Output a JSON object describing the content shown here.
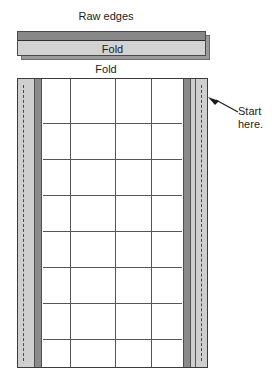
{
  "figure": {
    "title": "Raw edges",
    "strip": {
      "fold_label": "Fold",
      "raw_edge_color": "#888888",
      "face_color": "#d2d2d2",
      "depth_color": "#9a9a9a"
    },
    "fold_caption": "Fold",
    "callout": {
      "text": "Start here.",
      "arrow_direction": "left"
    },
    "panel": {
      "selvage_color": "#cfcfcf",
      "seam_band_color": "#8a8a8a",
      "grid_line_color": "#555555",
      "border_color": "#3b3b3b",
      "columns": 5,
      "rows": 8,
      "column_line_positions": [
        27,
        72,
        108,
        152
      ],
      "row_line_positions": [
        44,
        80,
        116,
        152,
        188,
        224,
        260
      ],
      "stitch_line_style": "dashed"
    }
  }
}
